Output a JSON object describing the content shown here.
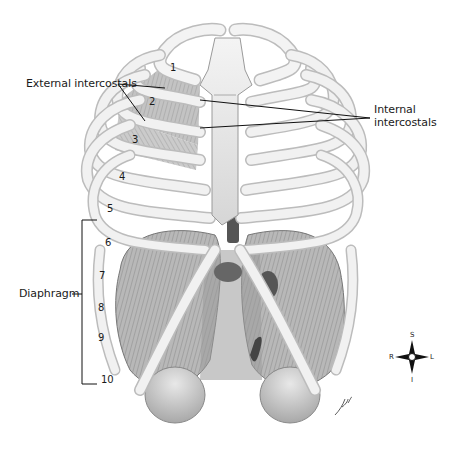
{
  "figure": {
    "labels": {
      "external_intercostals": "External intercostals",
      "internal_intercostals_line1": "Internal",
      "internal_intercostals_line2": "intercostals",
      "diaphragm": "Diaphragm"
    },
    "rib_numbers": [
      "1",
      "2",
      "3",
      "4",
      "5",
      "6",
      "7",
      "8",
      "9",
      "10"
    ],
    "compass": {
      "superior": "S",
      "inferior": "I",
      "right": "R",
      "left": "L"
    },
    "signature": "Jjh"
  }
}
